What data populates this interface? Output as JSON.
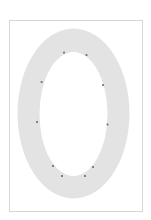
{
  "page": {
    "width": 151,
    "height": 220,
    "background_color": "#ffffff"
  },
  "frame": {
    "name": "page-border",
    "x": 9,
    "y": 20,
    "width": 134,
    "height": 192,
    "stroke_color": "#d6d6d6",
    "stroke_width": 1,
    "fill_color": "#ffffff"
  },
  "glyph": {
    "character": "O",
    "description": "elliptical annulus letter O outline",
    "fill_color": "#e3e3e3",
    "outer_ellipse": {
      "cx": 73.5,
      "cy": 113.5,
      "rx": 56,
      "ry": 85
    },
    "inner_ellipse": {
      "cx": 73.5,
      "cy": 114,
      "rx": 34,
      "ry": 62
    }
  },
  "control_points": {
    "color": "#6b6b6b",
    "size": 1.8,
    "count": 10,
    "points": [
      {
        "label": "p1",
        "x": 64.0,
        "y": 52.6
      },
      {
        "label": "p2",
        "x": 86.5,
        "y": 55.0
      },
      {
        "label": "p3",
        "x": 41.6,
        "y": 82.0
      },
      {
        "label": "p4",
        "x": 103.0,
        "y": 85.0
      },
      {
        "label": "p5",
        "x": 37.0,
        "y": 122.0
      },
      {
        "label": "p6",
        "x": 107.5,
        "y": 124.5
      },
      {
        "label": "p7",
        "x": 53.0,
        "y": 166.0
      },
      {
        "label": "p8",
        "x": 93.0,
        "y": 167.0
      },
      {
        "label": "p9",
        "x": 62.0,
        "y": 176.0
      },
      {
        "label": "p10",
        "x": 85.0,
        "y": 176.0
      }
    ]
  }
}
